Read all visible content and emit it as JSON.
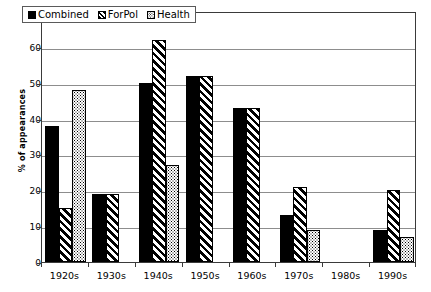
{
  "chart_data": {
    "type": "bar",
    "title": "",
    "subtitle": "",
    "xlabel": "",
    "ylabel": "% of appearances",
    "ylim": [
      0,
      70
    ],
    "yticks": [
      0,
      10,
      20,
      30,
      40,
      50,
      60,
      70
    ],
    "ytick_labels": [
      "0",
      "10",
      "20",
      "30",
      "40",
      "50",
      "60",
      "70"
    ],
    "grid": true,
    "grid_axis": "y",
    "legend_position": "top-left",
    "categories": [
      "1920s",
      "1930s",
      "1940s",
      "1950s",
      "1960s",
      "1970s",
      "1980s",
      "1990s"
    ],
    "series": [
      {
        "name": "Combined",
        "pattern": "solid-black",
        "color": "#000000",
        "values": [
          38,
          19,
          50,
          52,
          43,
          13,
          0,
          9
        ]
      },
      {
        "name": "ForPol",
        "pattern": "diagonal-stripes",
        "color": "#000000",
        "values": [
          15,
          19,
          62,
          52,
          43,
          21,
          0,
          20
        ]
      },
      {
        "name": "Health",
        "pattern": "fine-dots",
        "color": "#000000",
        "values": [
          48,
          0,
          27,
          0,
          0,
          9,
          0,
          7
        ]
      }
    ]
  },
  "legend": {
    "items": [
      {
        "label": "Combined",
        "series_key": "combined"
      },
      {
        "label": "ForPol",
        "series_key": "forpol"
      },
      {
        "label": "Health",
        "series_key": "health"
      }
    ]
  },
  "axes": {
    "y_title": "% of appearances"
  }
}
